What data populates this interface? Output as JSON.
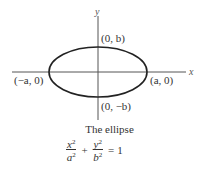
{
  "figure": {
    "axes": {
      "x_label": "x",
      "y_label": "y"
    },
    "points": {
      "top": "(0, b)",
      "bottom": "(0, −b)",
      "left": "(−a, 0)",
      "right": "(a, 0)"
    },
    "caption": "The ellipse",
    "equation": {
      "term1_num": "x",
      "term1_den": "a",
      "term2_num": "y",
      "term2_den": "b",
      "exponent": "2",
      "plus": "+",
      "equals": "=",
      "rhs": "1"
    },
    "colors": {
      "curve": "#222222",
      "axis": "#555555"
    }
  }
}
